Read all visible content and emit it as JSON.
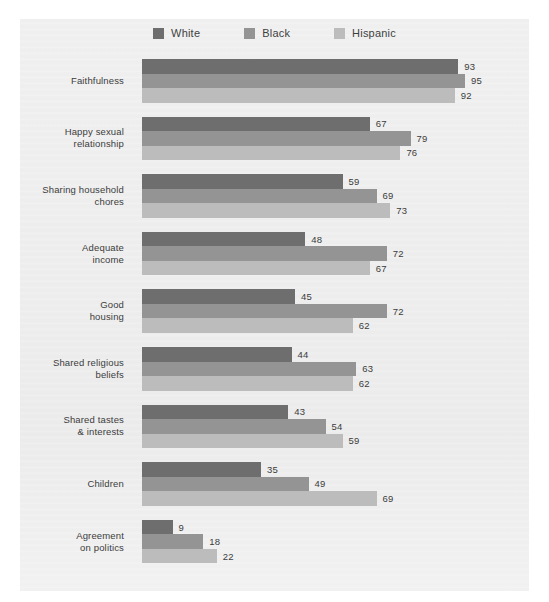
{
  "chart_data": {
    "type": "bar",
    "orientation": "horizontal",
    "title": "",
    "subtitle": "",
    "xlabel": "",
    "ylabel": "",
    "xlim": [
      0,
      100
    ],
    "grid": false,
    "legend_position": "top-center",
    "categories": [
      "Faithfulness",
      "Happy sexual relationship",
      "Sharing household chores",
      "Adequate income",
      "Good housing",
      "Shared religious beliefs",
      "Shared tastes & interests",
      "Children",
      "Agreement on politics"
    ],
    "category_lines": [
      [
        "Faithfulness"
      ],
      [
        "Happy sexual",
        "relationship"
      ],
      [
        "Sharing household",
        "chores"
      ],
      [
        "Adequate",
        "income"
      ],
      [
        "Good",
        "housing"
      ],
      [
        "Shared religious",
        "beliefs"
      ],
      [
        "Shared tastes",
        "& interests"
      ],
      [
        "Children"
      ],
      [
        "Agreement",
        "on politics"
      ]
    ],
    "series": [
      {
        "name": "White",
        "color": "#6e6e6e",
        "values": [
          93,
          67,
          59,
          48,
          45,
          44,
          43,
          35,
          9
        ]
      },
      {
        "name": "Black",
        "color": "#949494",
        "values": [
          95,
          79,
          69,
          72,
          72,
          63,
          54,
          49,
          18
        ]
      },
      {
        "name": "Hispanic",
        "color": "#bcbcbc",
        "values": [
          92,
          76,
          73,
          67,
          62,
          62,
          59,
          69,
          22
        ]
      }
    ]
  },
  "legend": {
    "items": [
      {
        "label": "White",
        "color": "#6e6e6e"
      },
      {
        "label": "Black",
        "color": "#949494"
      },
      {
        "label": "Hispanic",
        "color": "#bcbcbc"
      }
    ]
  },
  "colors": {
    "panel_background": "#eeeeee",
    "page_background": "#ffffff",
    "text": "#3c3c3c",
    "white_series": "#6e6e6e",
    "black_series": "#949494",
    "hispanic_series": "#bcbcbc"
  }
}
